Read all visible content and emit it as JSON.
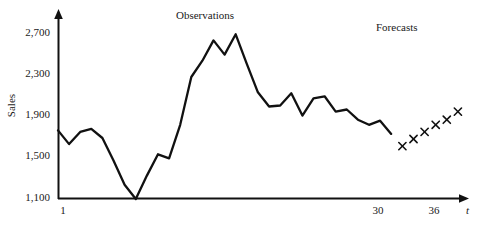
{
  "chart_data": {
    "type": "line",
    "title": "",
    "xlabel": "t",
    "ylabel": "Sales",
    "xlim": [
      1,
      38
    ],
    "ylim": [
      1100,
      2900
    ],
    "grid": false,
    "legend": "none",
    "y_ticks": [
      "1,100",
      "1,500",
      "1,900",
      "2,300",
      "2,700"
    ],
    "y_tick_values": [
      1100,
      1500,
      1900,
      2300,
      2700
    ],
    "x_ticks": [
      "1",
      "30",
      "36"
    ],
    "x_tick_values": [
      1,
      30,
      36
    ],
    "annotations": [
      {
        "text": "Observations",
        "x": 15,
        "y": 2870
      },
      {
        "text": "Forecasts",
        "x": 33,
        "y": 2790
      }
    ],
    "series": [
      {
        "name": "Observations",
        "marker": "none",
        "style": "line",
        "color": "#111111",
        "x": [
          1,
          2,
          3,
          4,
          5,
          6,
          7,
          8,
          9,
          10,
          11,
          12,
          13,
          14,
          15,
          16,
          17,
          18,
          19,
          20,
          21,
          22,
          23,
          24,
          25,
          26,
          27,
          28,
          29,
          30,
          31
        ],
        "values": [
          1775,
          1640,
          1760,
          1790,
          1700,
          1480,
          1240,
          1100,
          1330,
          1540,
          1500,
          1830,
          2300,
          2460,
          2660,
          2520,
          2720,
          2430,
          2150,
          2010,
          2020,
          2140,
          1920,
          2090,
          2110,
          1960,
          1980,
          1880,
          1830,
          1870,
          1740
        ]
      },
      {
        "name": "Forecasts",
        "marker": "x",
        "style": "markers",
        "color": "#111111",
        "x": [
          32,
          33,
          34,
          35,
          36,
          37
        ],
        "values": [
          1620,
          1690,
          1760,
          1830,
          1880,
          1960
        ]
      }
    ]
  },
  "axis": {
    "y_label": "Sales",
    "x_label": "t",
    "y_ticks": [
      {
        "label": "2,700"
      },
      {
        "label": "2,300"
      },
      {
        "label": "1,900"
      },
      {
        "label": "1,500"
      },
      {
        "label": "1,100"
      }
    ],
    "x_ticks": [
      {
        "label": "1"
      },
      {
        "label": "30"
      },
      {
        "label": "36"
      }
    ]
  },
  "annotations": {
    "observations": "Observations",
    "forecasts": "Forecasts"
  },
  "colors": {
    "line": "#111111",
    "axis": "#111111",
    "text": "#1a1a1a",
    "background": "#ffffff"
  }
}
